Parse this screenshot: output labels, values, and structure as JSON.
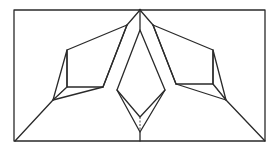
{
  "diagram": {
    "type": "origami-fold-diagram",
    "colors": {
      "background": "#ffffff",
      "paper": "#e4e4e4",
      "flap": "#d6d6d6",
      "line": "#2a2a2a"
    },
    "outer_rect": {
      "x": 14,
      "y": 10,
      "width": 251,
      "height": 131
    },
    "apex_top": {
      "x": 140,
      "y": 10
    },
    "apex_bottom": {
      "x": 140,
      "y": 141
    },
    "left_flap": {
      "quad": [
        [
          67,
          50
        ],
        [
          127,
          25
        ],
        [
          103,
          87
        ],
        [
          67,
          87
        ]
      ],
      "anchor": [
        53,
        100
      ],
      "diagonal_to_corner": [
        [
          15,
          141
        ],
        [
          53,
          100
        ]
      ]
    },
    "right_flap": {
      "quad": [
        [
          153,
          25
        ],
        [
          213,
          50
        ],
        [
          213,
          84
        ],
        [
          176,
          84
        ]
      ],
      "anchor": [
        226,
        100
      ],
      "diagonal_to_corner": [
        [
          226,
          100
        ],
        [
          265,
          141
        ]
      ]
    },
    "center_kite": {
      "diamond": [
        [
          140,
          30
        ],
        [
          165,
          90
        ],
        [
          140,
          117
        ],
        [
          117,
          90
        ]
      ],
      "base": [
        140,
        132
      ]
    }
  }
}
